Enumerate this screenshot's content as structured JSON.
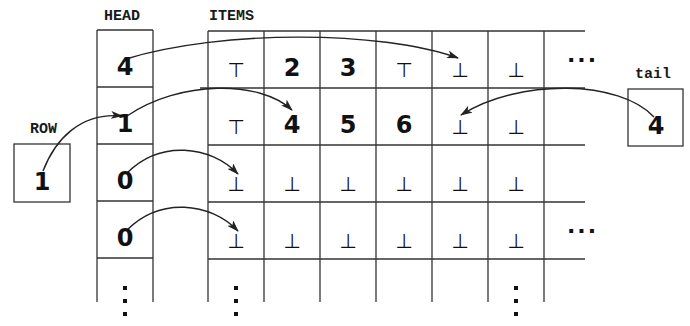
{
  "labels": {
    "head": "HEAD",
    "items": "ITEMS",
    "row": "ROW",
    "tail": "tail"
  },
  "row_box": {
    "value": "1"
  },
  "tail_box": {
    "value": "4"
  },
  "head_column": {
    "values": [
      "4",
      "1",
      "0",
      "0"
    ],
    "continuation": "⋮"
  },
  "items_grid": {
    "rows": [
      [
        "⊤",
        "2",
        "3",
        "⊤",
        "⊥",
        "⊥"
      ],
      [
        "⊤",
        "4",
        "5",
        "6",
        "⊥",
        "⊥"
      ],
      [
        "⊥",
        "⊥",
        "⊥",
        "⊥",
        "⊥",
        "⊥"
      ],
      [
        "⊥",
        "⊥",
        "⊥",
        "⊥",
        "⊥",
        "⊥"
      ]
    ],
    "row_continuation": "...",
    "column_continuation": "⋮"
  },
  "arrows": [
    {
      "from": "head[0]",
      "to": "items[0][4]"
    },
    {
      "from": "head[1]",
      "to": "items[1][1]"
    },
    {
      "from": "head[2]",
      "to": "items[2][0]"
    },
    {
      "from": "head[3]",
      "to": "items[3][0]"
    },
    {
      "from": "row",
      "to": "head[1]"
    },
    {
      "from": "tail",
      "to": "items[1][4]"
    }
  ],
  "colors": {
    "ink": "#1a1a1a",
    "background": "#ffffff"
  }
}
